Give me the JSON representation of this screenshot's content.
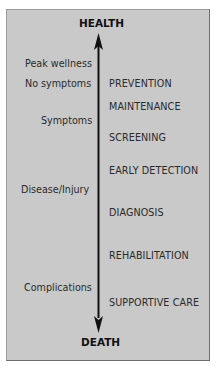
{
  "diagram": {
    "top_label": "HEALTH",
    "bottom_label": "DEATH",
    "left_labels": [
      {
        "text": "Peak wellness",
        "y": 58
      },
      {
        "text": "No symptoms",
        "y": 78
      },
      {
        "text": "Symptoms",
        "y": 115
      },
      {
        "text": "Disease/Injury",
        "y": 184
      },
      {
        "text": "Complications",
        "y": 282
      }
    ],
    "right_labels": [
      {
        "text": "PREVENTION",
        "y": 78
      },
      {
        "text": "MAINTENANCE",
        "y": 101
      },
      {
        "text": "SCREENING",
        "y": 132
      },
      {
        "text": "EARLY DETECTION",
        "y": 165
      },
      {
        "text": "DIAGNOSIS",
        "y": 207
      },
      {
        "text": "REHABILITATION",
        "y": 250
      },
      {
        "text": "SUPPORTIVE CARE",
        "y": 297
      }
    ],
    "arrow": {
      "direction": "bidirectional-vertical",
      "color": "#111111"
    },
    "colors": {
      "panel_bg": "#c9c9c9",
      "text": "#2b2b2b"
    }
  }
}
